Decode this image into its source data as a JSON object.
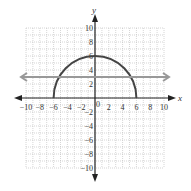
{
  "chart_data": {
    "type": "line",
    "title": "",
    "xlabel": "x",
    "ylabel": "y",
    "xlim": [
      -10,
      10
    ],
    "ylim": [
      -10,
      10
    ],
    "grid": true,
    "x_ticks": [
      -10,
      -8,
      -6,
      -4,
      -2,
      0,
      2,
      4,
      6,
      8,
      10
    ],
    "y_ticks": [
      -10,
      -8,
      -6,
      -4,
      -2,
      2,
      4,
      6,
      8,
      10
    ],
    "x_tick_labels": [
      "−10",
      "−8",
      "−6",
      "−4",
      "−2",
      "0",
      "2",
      "4",
      "6",
      "8",
      "10"
    ],
    "y_tick_labels": [
      "−10",
      "−8",
      "−6",
      "−4",
      "−2",
      "2",
      "4",
      "6",
      "8",
      "10"
    ],
    "series": [
      {
        "name": "semicircle y = sqrt(36 - x^2)",
        "kind": "semicircle",
        "center": [
          0,
          0
        ],
        "radius": 6,
        "x_range": [
          -6,
          6
        ],
        "color": "#444444"
      },
      {
        "name": "horizontal line y = 3",
        "kind": "horizontal-line",
        "y": 3,
        "arrows": "both",
        "color": "#999999"
      }
    ]
  },
  "labels": {
    "x_axis": "x",
    "y_axis": "y",
    "origin": "0"
  },
  "colors": {
    "axis": "#222222",
    "grid": "#bbbbbb",
    "semicircle": "#444444",
    "line": "#999999"
  }
}
